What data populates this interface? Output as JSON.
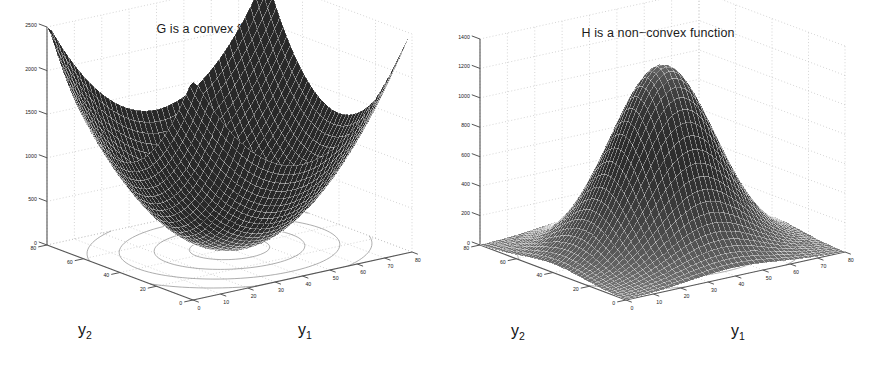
{
  "page": {
    "background": "#ffffff",
    "width": 877,
    "height": 374,
    "kind": "two-panel-matlab-3d-surface-figure"
  },
  "figures": [
    {
      "id": "left",
      "title": "G is a convex function",
      "xlabel": "y",
      "xlabel_sub": "1",
      "ylabel": "y",
      "ylabel_sub": "2",
      "zticks": [
        "0",
        "500",
        "1000",
        "1500",
        "2000",
        "2500"
      ],
      "xticks": [
        "0",
        "10",
        "20",
        "30",
        "40",
        "50",
        "60",
        "70",
        "80"
      ],
      "yticks": [
        "0",
        "20",
        "40",
        "60",
        "80"
      ],
      "surface_color": "#5e5e5e",
      "mesh_color": "#2c2c2c",
      "grid_color": "#b8b8b8",
      "axis_color": "#555555"
    },
    {
      "id": "right",
      "title": "H is a non−convex function",
      "xlabel": "y",
      "xlabel_sub": "1",
      "ylabel": "y",
      "ylabel_sub": "2",
      "zticks": [
        "0",
        "200",
        "400",
        "600",
        "800",
        "1000",
        "1200",
        "1400"
      ],
      "xticks": [
        "0",
        "10",
        "20",
        "30",
        "40",
        "50",
        "60",
        "70",
        "80"
      ],
      "yticks": [
        "0",
        "20",
        "40",
        "60",
        "80"
      ],
      "surface_color": "#4a4a4a",
      "mesh_color": "#1f1f1f",
      "grid_color": "#b8b8b8",
      "axis_color": "#555555"
    }
  ],
  "chart_data": [
    {
      "type": "surface",
      "title": "G is a convex function",
      "xlabel": "y1",
      "ylabel": "y2",
      "zlabel": "",
      "xlim": [
        0,
        80
      ],
      "ylim": [
        0,
        80
      ],
      "zlim": [
        0,
        2500
      ],
      "xticks": [
        0,
        10,
        20,
        30,
        40,
        50,
        60,
        70,
        80
      ],
      "yticks": [
        0,
        20,
        40,
        60,
        80
      ],
      "zticks": [
        0,
        500,
        1000,
        1500,
        2000,
        2500
      ],
      "grid": true,
      "legend": "none",
      "surface_shape": "convex-paraboloid-bowl",
      "contours_at_base": true,
      "contour_shape": "concentric-ellipses",
      "description": "Elliptic paraboloid bowl with minimum near the centre of the y1-y2 domain rising to about 2500 at the domain corners.",
      "formula_estimate": "G(y1,y2) = 0.8*(y1-40)^2 + 0.8*(y2-40)^2",
      "sample_points": [
        {
          "y1": 0,
          "y2": 0,
          "z": 2560
        },
        {
          "y1": 0,
          "y2": 40,
          "z": 1280
        },
        {
          "y1": 0,
          "y2": 80,
          "z": 2560
        },
        {
          "y1": 40,
          "y2": 0,
          "z": 1280
        },
        {
          "y1": 40,
          "y2": 40,
          "z": 0
        },
        {
          "y1": 40,
          "y2": 80,
          "z": 1280
        },
        {
          "y1": 80,
          "y2": 0,
          "z": 2560
        },
        {
          "y1": 80,
          "y2": 40,
          "z": 1280
        },
        {
          "y1": 80,
          "y2": 80,
          "z": 2560
        }
      ]
    },
    {
      "type": "surface",
      "title": "H is a non−convex function",
      "xlabel": "y1",
      "ylabel": "y2",
      "zlabel": "",
      "xlim": [
        0,
        80
      ],
      "ylim": [
        0,
        80
      ],
      "zlim": [
        0,
        1400
      ],
      "xticks": [
        0,
        10,
        20,
        30,
        40,
        50,
        60,
        70,
        80
      ],
      "yticks": [
        0,
        20,
        40,
        60,
        80
      ],
      "zticks": [
        0,
        200,
        400,
        600,
        800,
        1000,
        1200,
        1400
      ],
      "grid": true,
      "legend": "none",
      "surface_shape": "central-peak-with-four-falling-lobes",
      "contours_at_base": true,
      "contour_shape": "saddle-like-non-concentric",
      "description": "Sharp central peak reaching about 1250 at the middle of the y1-y2 domain, falling steeply to 0 toward all four corners.",
      "formula_estimate": "H(y1,y2) = 1250 * exp(-((y1-40)^2 + (y2-40)^2)/520)",
      "sample_points": [
        {
          "y1": 0,
          "y2": 0,
          "z": 0
        },
        {
          "y1": 0,
          "y2": 40,
          "z": 5
        },
        {
          "y1": 0,
          "y2": 80,
          "z": 0
        },
        {
          "y1": 40,
          "y2": 0,
          "z": 5
        },
        {
          "y1": 40,
          "y2": 40,
          "z": 1250
        },
        {
          "y1": 40,
          "y2": 80,
          "z": 5
        },
        {
          "y1": 80,
          "y2": 0,
          "z": 0
        },
        {
          "y1": 80,
          "y2": 40,
          "z": 5
        },
        {
          "y1": 80,
          "y2": 80,
          "z": 0
        }
      ]
    }
  ]
}
